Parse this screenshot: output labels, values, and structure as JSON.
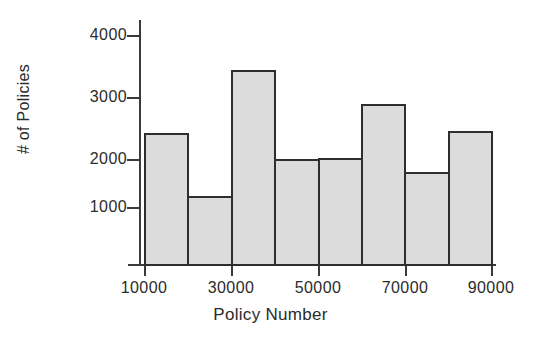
{
  "chart_data": {
    "type": "bar",
    "title": "",
    "subtitle": "",
    "xlabel": "Policy Number",
    "ylabel": "# of Policies",
    "grid": false,
    "legend": false,
    "legend_position": "none",
    "bin_width": 10000,
    "xlim": [
      10000,
      90000
    ],
    "ylim": [
      0,
      4300
    ],
    "xticks": [
      10000,
      30000,
      50000,
      70000,
      90000
    ],
    "xtick_labels": [
      "10000",
      "30000",
      "50000",
      "70000",
      "90000"
    ],
    "yticks": [
      1000,
      2000,
      3000,
      4000
    ],
    "ytick_labels": [
      "1000",
      "2000",
      "3000",
      "4000"
    ],
    "bin_edges": [
      10000,
      20000,
      30000,
      40000,
      50000,
      60000,
      70000,
      80000,
      90000
    ],
    "categories": [
      "10000-20000",
      "20000-30000",
      "30000-40000",
      "40000-50000",
      "50000-60000",
      "60000-70000",
      "70000-80000",
      "80000-90000"
    ],
    "values": [
      2300,
      1200,
      3400,
      1850,
      1870,
      2800,
      1620,
      2330
    ],
    "bar_fill_color": "#dcdcdc",
    "bar_edge_color": "#2e2e2e",
    "axis_color": "#3a3a3a",
    "background_color": "#ffffff"
  }
}
